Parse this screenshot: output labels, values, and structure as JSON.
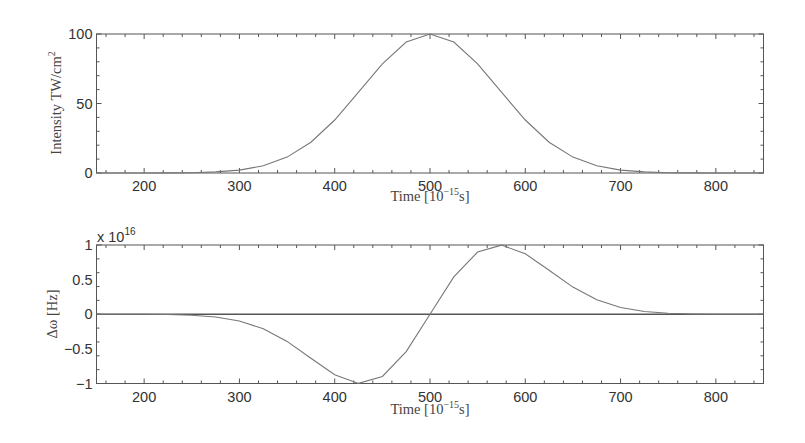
{
  "chart_data": [
    {
      "type": "line",
      "title": "",
      "xlabel": "Time [10^-15 s]",
      "ylabel": "Intensity TW/cm^2",
      "xlim": [
        150,
        850
      ],
      "ylim": [
        0,
        100
      ],
      "xticks": [
        200,
        300,
        400,
        500,
        600,
        700,
        800
      ],
      "yticks": [
        0,
        50,
        100
      ],
      "grid": false,
      "legend": null,
      "series": [
        {
          "name": "Intensity",
          "x": [
            150,
            175,
            200,
            225,
            250,
            275,
            300,
            325,
            350,
            375,
            400,
            425,
            450,
            475,
            500,
            525,
            550,
            575,
            600,
            625,
            650,
            675,
            700,
            725,
            750,
            775,
            800,
            825,
            850
          ],
          "values": [
            0.0,
            0.0,
            0.02,
            0.07,
            0.24,
            0.76,
            2.11,
            5.21,
            11.42,
            22.16,
            38.12,
            58.13,
            78.58,
            94.15,
            100.0,
            94.15,
            78.58,
            58.13,
            38.12,
            22.16,
            11.42,
            5.21,
            2.11,
            0.76,
            0.24,
            0.07,
            0.02,
            0.0,
            0.0
          ]
        }
      ]
    },
    {
      "type": "line",
      "title": "",
      "xlabel": "Time [10^-15 s]",
      "ylabel": "Δω [Hz]",
      "y_multiplier": "x 10^16",
      "xlim": [
        150,
        850
      ],
      "ylim": [
        -1,
        1
      ],
      "xticks": [
        200,
        300,
        400,
        500,
        600,
        700,
        800
      ],
      "yticks": [
        -1,
        -0.5,
        0,
        0.5,
        1
      ],
      "grid": false,
      "legend": null,
      "series": [
        {
          "name": "Frequency shift",
          "x": [
            150,
            175,
            200,
            225,
            250,
            275,
            300,
            325,
            350,
            375,
            400,
            425,
            450,
            475,
            500,
            525,
            550,
            575,
            600,
            625,
            650,
            675,
            700,
            725,
            750,
            775,
            800,
            825,
            850
          ],
          "values": [
            0.0,
            0.0,
            -0.001,
            -0.004,
            -0.014,
            -0.039,
            -0.097,
            -0.209,
            -0.392,
            -0.634,
            -0.873,
            -0.998,
            -0.899,
            -0.539,
            0.0,
            0.539,
            0.899,
            0.998,
            0.873,
            0.634,
            0.392,
            0.209,
            0.097,
            0.039,
            0.014,
            0.004,
            0.001,
            0.0,
            0.0
          ]
        },
        {
          "name": "Zero line",
          "x": [
            150,
            850
          ],
          "values": [
            0,
            0
          ]
        }
      ]
    }
  ],
  "top": {
    "ylabel_main": "Intensity TW/cm",
    "ylabel_sup": "2",
    "xlabel_main": "Time [10",
    "xlabel_sup": "−15",
    "xlabel_end": "s]",
    "yticklabels": [
      "0",
      "50",
      "100"
    ],
    "xticklabels": [
      "200",
      "300",
      "400",
      "500",
      "600",
      "700",
      "800"
    ]
  },
  "bottom": {
    "ylabel": "Δω [Hz]",
    "multiplier_base": "x 10",
    "multiplier_exp": "16",
    "xlabel_main": "Time [10",
    "xlabel_sup": "−15",
    "xlabel_end": "s]",
    "yticklabels": [
      "−1",
      "−0.5",
      "0",
      "0.5",
      "1"
    ],
    "xticklabels": [
      "200",
      "300",
      "400",
      "500",
      "600",
      "700",
      "800"
    ]
  }
}
